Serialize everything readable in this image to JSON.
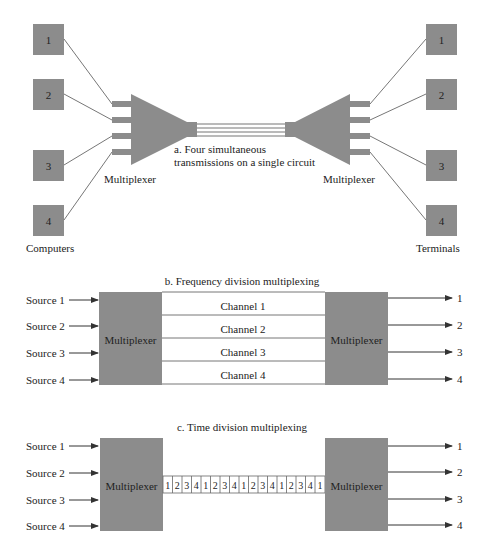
{
  "colors": {
    "box": "#8c8c8c",
    "line": "#777777",
    "text": "#222222",
    "background": "#ffffff"
  },
  "panel_a": {
    "caption_line1": "a.  Four simultaneous",
    "caption_line2": "transmissions on a single circuit",
    "left_label": "Computers",
    "right_label": "Terminals",
    "left_mux_label": "Multiplexer",
    "right_mux_label": "Multiplexer",
    "computers": [
      "1",
      "2",
      "3",
      "4"
    ],
    "terminals": [
      "1",
      "2",
      "3",
      "4"
    ]
  },
  "panel_b": {
    "title": "b.  Frequency division multiplexing",
    "sources": [
      "Source 1",
      "Source 2",
      "Source 3",
      "Source 4"
    ],
    "left_mux_label": "Multiplexer",
    "right_mux_label": "Multiplexer",
    "channels": [
      "Channel 1",
      "Channel 2",
      "Channel 3",
      "Channel 4"
    ],
    "outputs": [
      "1",
      "2",
      "3",
      "4"
    ]
  },
  "panel_c": {
    "title": "c.  Time division multiplexing",
    "sources": [
      "Source 1",
      "Source 2",
      "Source 3",
      "Source 4"
    ],
    "left_mux_label": "Multiplexer",
    "right_mux_label": "Multiplexer",
    "slots": [
      "1",
      "2",
      "3",
      "4",
      "1",
      "2",
      "3",
      "4",
      "1",
      "2",
      "3",
      "4",
      "1",
      "2",
      "3",
      "4",
      "1"
    ],
    "outputs": [
      "1",
      "2",
      "3",
      "4"
    ]
  }
}
